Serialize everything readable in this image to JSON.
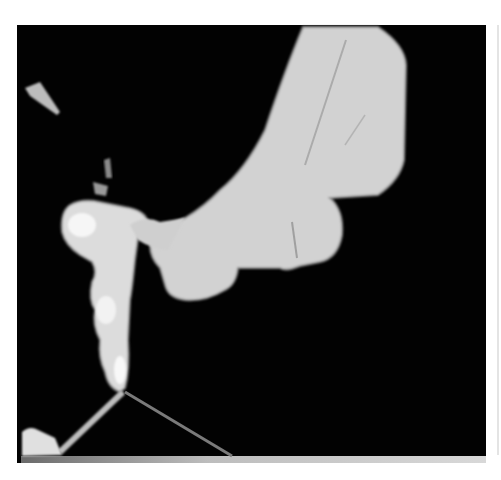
{
  "image": {
    "subject": "grayscale radiographic scan with bright bone-like structures on black background",
    "colors": {
      "background": "#ffffff",
      "frame": "#020202",
      "structure": "#d4d4d4",
      "highlight": "#f4f4f4",
      "edge": "#8a8a8a"
    }
  }
}
